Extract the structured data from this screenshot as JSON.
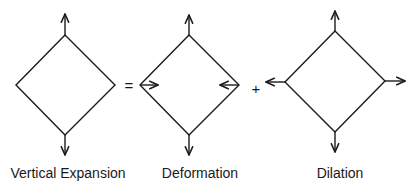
{
  "diagram": {
    "stroke_color": "#1a1a1a",
    "background": "#ffffff",
    "operators": {
      "equals": "=",
      "plus": "+"
    },
    "panels": [
      {
        "id": "vertical-expansion",
        "label": "Vertical Expansion",
        "center": [
          65,
          85
        ],
        "half_width": 50,
        "half_height": 50,
        "arrows": [
          "up-outward",
          "down-outward"
        ]
      },
      {
        "id": "deformation",
        "label": "Deformation",
        "center": [
          189,
          85
        ],
        "half_width": 50,
        "half_height": 50,
        "arrows": [
          "up-outward",
          "down-outward",
          "left-inward",
          "right-inward"
        ]
      },
      {
        "id": "dilation",
        "label": "Dilation",
        "center": [
          335,
          82
        ],
        "half_width": 50,
        "half_height": 50,
        "arrows": [
          "up-outward",
          "down-outward",
          "left-outward",
          "right-outward"
        ]
      }
    ]
  }
}
